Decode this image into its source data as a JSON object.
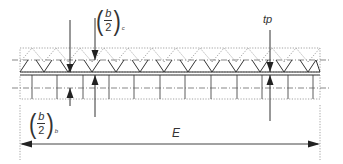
{
  "diagram": {
    "labels": {
      "b2c": {
        "numerator": "b",
        "denominator": "2",
        "subscript": "c"
      },
      "b2b": {
        "numerator": "b",
        "denominator": "2",
        "subscript": "b"
      },
      "tp": "tp",
      "E": "E"
    },
    "colors": {
      "line": "#333333",
      "dotted": "#8a8a8a",
      "dimension": "#444444"
    }
  }
}
